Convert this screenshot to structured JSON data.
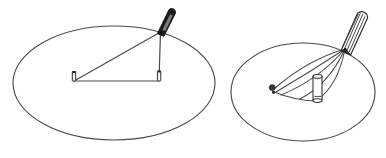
{
  "document": {
    "title": "Two-panel line drawing of a stylus on an elliptical surface",
    "background_color": "#ffffff",
    "ink_color": "#3a3a3a",
    "dark_ink_color": "#1a1a1a",
    "width": 386,
    "height": 158,
    "panel_count": 2
  },
  "figures": [
    {
      "id": "left-figure",
      "name": "stylus-triangle-diagram",
      "description": "Ellipse with a dark solid stylus at the upper right rim and a triangle drawn from the stylus tip down to two small pins",
      "ellipse": {
        "center_x": 114,
        "center_y": 83,
        "radius_x": 101,
        "radius_y": 57,
        "rotation_deg": 0,
        "stroke": "#4a4a4a",
        "stroke_width": 1.1,
        "fill": "none"
      },
      "stylus": {
        "name": "solid-stylus",
        "style": "solid-filled",
        "tip_x": 160,
        "tip_y": 32,
        "tail_x": 172,
        "tail_y": 9,
        "width": 7,
        "fill": "#1c1c1c"
      },
      "pins": [
        {
          "name": "left-pin",
          "x": 74,
          "y": 77,
          "height": 9
        },
        {
          "name": "right-pin",
          "x": 159,
          "y": 76,
          "height": 9
        }
      ],
      "triangle_vertices": [
        {
          "x": 160,
          "y": 32
        },
        {
          "x": 74,
          "y": 81
        },
        {
          "x": 159,
          "y": 81
        }
      ]
    },
    {
      "id": "right-figure",
      "name": "stylus-cylinder-diagram",
      "description": "Ellipse with a hatched outlined stylus at the upper right rim, a small upright cylinder inside, a knob pin at the left, and a fan of curved arcs converging at the stylus tip",
      "ellipse": {
        "center_x": 303,
        "center_y": 92,
        "radius_x": 72,
        "radius_y": 49,
        "rotation_deg": 0,
        "stroke": "#4a4a4a",
        "stroke_width": 1.1,
        "fill": "none"
      },
      "stylus": {
        "name": "hatched-stylus",
        "style": "outlined-hatched",
        "tip_x": 345,
        "tip_y": 49,
        "tail_x": 363,
        "tail_y": 12,
        "width": 11,
        "hatch_line_count": 4,
        "stroke": "#2a2a2a",
        "fill": "#ffffff"
      },
      "cylinder": {
        "name": "upright-cylinder-peg",
        "x": 313,
        "y": 75,
        "width": 9,
        "height": 26,
        "stroke": "#2a2a2a",
        "fill": "#ffffff"
      },
      "knob_pin": {
        "name": "left-knob-pin",
        "x": 272,
        "y": 89,
        "radius": 3
      },
      "arc_count": 5,
      "arc_sweep_note": "Curved strokes fan from the stylus tip around and past the cylinder down to the left knob"
    }
  ],
  "labels": []
}
